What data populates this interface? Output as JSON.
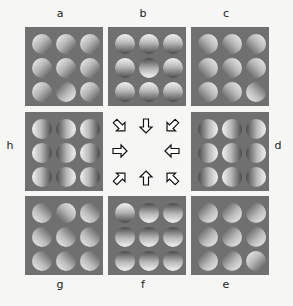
{
  "panels": [
    {
      "id": "a",
      "label": "a",
      "x": 25,
      "y": 27,
      "lx": 54,
      "ly": 12,
      "light": "top-left",
      "odd": 7,
      "odd_light": "bottom-right"
    },
    {
      "id": "b",
      "label": "b",
      "x": 108,
      "y": 27,
      "lx": 137,
      "ly": 12,
      "light": "top",
      "odd": 4,
      "odd_light": "bottom"
    },
    {
      "id": "c",
      "label": "c",
      "x": 191,
      "y": 27,
      "lx": 220,
      "ly": 12,
      "light": "top-right",
      "odd": 8,
      "odd_light": "bottom-left"
    },
    {
      "id": "h",
      "label": "h",
      "x": 25,
      "y": 112,
      "lx": 4,
      "ly": 144,
      "light": "left",
      "odd": -1,
      "odd_light": "right"
    },
    {
      "id": "d",
      "label": "d",
      "x": 191,
      "y": 112,
      "lx": 272,
      "ly": 144,
      "light": "right",
      "odd": -1,
      "odd_light": "left"
    },
    {
      "id": "g",
      "label": "g",
      "x": 25,
      "y": 196,
      "lx": 54,
      "ly": 283,
      "light": "bottom-left",
      "odd": 1,
      "odd_light": "top-right"
    },
    {
      "id": "f",
      "label": "f",
      "x": 108,
      "y": 196,
      "lx": 137,
      "ly": 283,
      "light": "bottom",
      "odd": 0,
      "odd_light": "top"
    },
    {
      "id": "e",
      "label": "e",
      "x": 191,
      "y": 196,
      "lx": 220,
      "ly": 283,
      "light": "bottom-right",
      "odd": 8,
      "odd_light": "top-left"
    }
  ],
  "arrows": [
    {
      "name": "arrow-down-right",
      "x": 112,
      "y": 118,
      "rot": 135
    },
    {
      "name": "arrow-down",
      "x": 138,
      "y": 118,
      "rot": 180
    },
    {
      "name": "arrow-down-left",
      "x": 164,
      "y": 118,
      "rot": 225
    },
    {
      "name": "arrow-right",
      "x": 112,
      "y": 143,
      "rot": 90
    },
    {
      "name": "arrow-left",
      "x": 164,
      "y": 143,
      "rot": 270
    },
    {
      "name": "arrow-up-right",
      "x": 112,
      "y": 170,
      "rot": 45
    },
    {
      "name": "arrow-up",
      "x": 138,
      "y": 170,
      "rot": 0
    },
    {
      "name": "arrow-up-left",
      "x": 164,
      "y": 170,
      "rot": 315
    }
  ],
  "colors": {
    "panel": "#707070",
    "background": "#f6f6f4",
    "label": "#222222"
  }
}
